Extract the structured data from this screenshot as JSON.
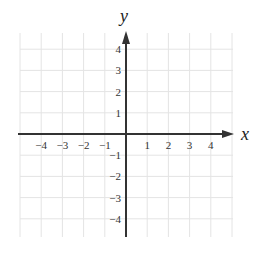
{
  "diagram": {
    "type": "coordinate-plane",
    "x_axis_label": "x",
    "y_axis_label": "y",
    "x_range": [
      -5,
      5
    ],
    "y_range": [
      -5,
      5
    ],
    "x_ticks": [
      {
        "value": -4,
        "label": "−4"
      },
      {
        "value": -3,
        "label": "−3"
      },
      {
        "value": -2,
        "label": "−2"
      },
      {
        "value": -1,
        "label": "−1"
      },
      {
        "value": 1,
        "label": "1"
      },
      {
        "value": 2,
        "label": "2"
      },
      {
        "value": 3,
        "label": "3"
      },
      {
        "value": 4,
        "label": "4"
      }
    ],
    "y_ticks": [
      {
        "value": 4,
        "label": "4"
      },
      {
        "value": 3,
        "label": "3"
      },
      {
        "value": 2,
        "label": "2"
      },
      {
        "value": 1,
        "label": "1"
      },
      {
        "value": -1,
        "label": "−1"
      },
      {
        "value": -2,
        "label": "−2"
      },
      {
        "value": -3,
        "label": "−3"
      },
      {
        "value": -4,
        "label": "−4"
      }
    ],
    "grid": true,
    "colors": {
      "grid": "#e4e4e4",
      "axis": "#333333",
      "text": "#333333"
    }
  }
}
